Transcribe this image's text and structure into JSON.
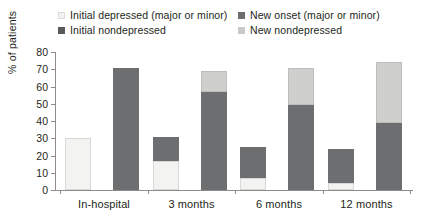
{
  "legend": {
    "entries": [
      {
        "label": "Initial depressed (major or minor)",
        "swatch": "initial-depressed",
        "color": "#f3f3f1"
      },
      {
        "label": "Initial nondepressed",
        "swatch": "initial-nondepressed",
        "color": "#58595b"
      },
      {
        "label": "New onset (major or minor)",
        "swatch": "new-onset",
        "color": "#6d6e70"
      },
      {
        "label": "New nondepressed",
        "swatch": "new-nondepressed",
        "color": "#c9cac8"
      }
    ]
  },
  "axis": {
    "y_label": "% of patients",
    "y_ticks": [
      "0",
      "10",
      "20",
      "30",
      "40",
      "50",
      "60",
      "70",
      "80"
    ],
    "x_labels": [
      "In-hospital",
      "3 months",
      "6 months",
      "12 months"
    ]
  },
  "chart_data": {
    "type": "bar",
    "title": "",
    "xlabel": "",
    "ylabel": "% of patients",
    "ylim": [
      0,
      80
    ],
    "ytick_step": 10,
    "grid": false,
    "legend_position": "top",
    "stacked": true,
    "grouped": true,
    "categories": [
      "In-hospital",
      "3 months",
      "6 months",
      "12 months"
    ],
    "bars_per_group": 2,
    "series": [
      {
        "name": "Initial depressed (major or minor)",
        "bar": 1,
        "stack": "bottom",
        "color": "#f3f3f1",
        "values": [
          30,
          17,
          7,
          4
        ]
      },
      {
        "name": "New onset (major or minor)",
        "bar": 1,
        "stack": "top",
        "color": "#6d6e70",
        "values": [
          0,
          14,
          18,
          20
        ]
      },
      {
        "name": "Initial nondepressed",
        "bar": 2,
        "stack": "bottom",
        "color": "#6d6e70",
        "values": [
          71,
          57,
          49,
          39
        ]
      },
      {
        "name": "New nondepressed",
        "bar": 2,
        "stack": "top",
        "color": "#cfd0ce",
        "values": [
          0,
          12,
          22,
          35
        ]
      }
    ],
    "bar_totals": {
      "depressed_bar": [
        30,
        31,
        25,
        24
      ],
      "nondepressed_bar": [
        71,
        69,
        71,
        74
      ]
    }
  }
}
